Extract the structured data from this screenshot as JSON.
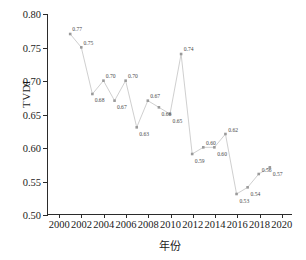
{
  "chart_data": {
    "type": "line",
    "title": "",
    "xlabel": "年份",
    "ylabel": "TVDI",
    "xlim": [
      1999,
      2021
    ],
    "ylim": [
      0.5,
      0.8
    ],
    "grid": false,
    "legend": null,
    "marker": "square",
    "line_color": "#c9c9c9",
    "marker_color": "#9a9a9a",
    "label_color": "#4a4a4a",
    "axis_color": "#2b2b2b",
    "xticks": [
      2000,
      2002,
      2004,
      2006,
      2008,
      2010,
      2012,
      2014,
      2016,
      2018,
      2020
    ],
    "yticks": [
      "0.50",
      "0.55",
      "0.60",
      "0.65",
      "0.70",
      "0.75",
      "0.80"
    ],
    "x": [
      2001,
      2002,
      2003,
      2004,
      2005,
      2006,
      2007,
      2008,
      2009,
      2010,
      2011,
      2012,
      2013,
      2014,
      2015,
      2016,
      2017,
      2018,
      2019
    ],
    "values": [
      0.77,
      0.75,
      0.68,
      0.7,
      0.67,
      0.7,
      0.63,
      0.67,
      0.66,
      0.65,
      0.74,
      0.59,
      0.6,
      0.6,
      0.62,
      0.53,
      0.54,
      0.56,
      0.57
    ],
    "point_labels": [
      "0.77",
      "0.75",
      "0.68",
      "0.70",
      "0.67",
      "0.70",
      "0.63",
      "0.67",
      "0.66",
      "0.65",
      "0.74",
      "0.59",
      "0.60",
      "0.60",
      "0.62",
      "0.53",
      "0.54",
      "0.56",
      "0.57"
    ]
  }
}
